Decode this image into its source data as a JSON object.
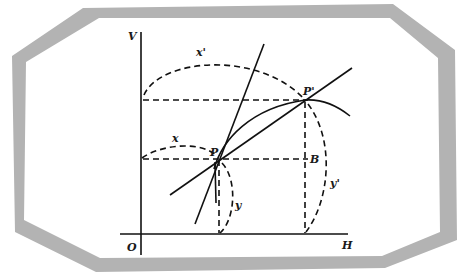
{
  "frame": {
    "band_color": "#b3b3b3",
    "inner_color": "#ffffff"
  },
  "axes": {
    "vertical_label": "V",
    "horizontal_label": "H",
    "origin_label": "O"
  },
  "points": {
    "p_label": "P",
    "p_prime_label": "P'",
    "b_label": "B"
  },
  "arcs": {
    "x_label": "x",
    "x_prime_label": "x'",
    "y_label": "y",
    "y_prime_label": "y'"
  },
  "colors": {
    "ink": "#111111"
  }
}
